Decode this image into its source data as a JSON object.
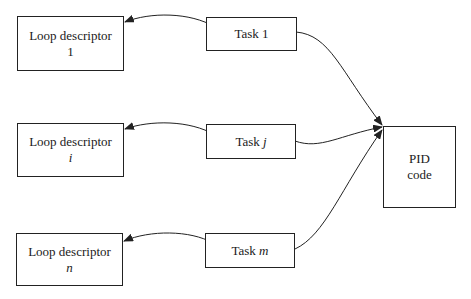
{
  "loop_descriptors": [
    {
      "label": "Loop descriptor",
      "index": "1"
    },
    {
      "label": "Loop descriptor",
      "index": "i"
    },
    {
      "label": "Loop descriptor",
      "index": "n"
    }
  ],
  "tasks": [
    {
      "label": "Task",
      "index": "1"
    },
    {
      "label": "Task",
      "index": "j"
    },
    {
      "label": "Task",
      "index": "m"
    }
  ],
  "pid": {
    "line1": "PID",
    "line2": "code"
  }
}
